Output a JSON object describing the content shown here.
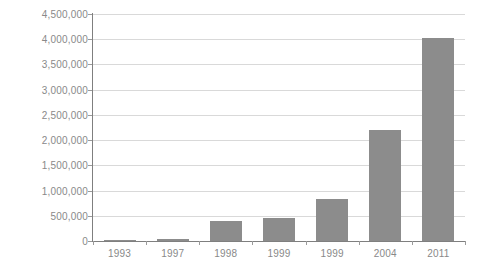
{
  "chart_data": {
    "type": "bar",
    "title": "",
    "subtitle": "",
    "xlabel": "",
    "ylabel": "",
    "categories": [
      "1993",
      "1997",
      "1998",
      "1999",
      "1999",
      "2004",
      "2011"
    ],
    "values": [
      20000,
      40000,
      400000,
      450000,
      830000,
      2200000,
      4030000
    ],
    "series": [
      {
        "name": "",
        "values": [
          20000,
          40000,
          400000,
          450000,
          830000,
          2200000,
          4030000
        ]
      }
    ],
    "ylim": [
      0,
      4500000
    ],
    "ytick_values": [
      0,
      500000,
      1000000,
      1500000,
      2000000,
      2500000,
      3000000,
      3500000,
      4000000,
      4500000
    ],
    "ytick_labels": [
      "0",
      "500,000",
      "1,000,000",
      "1,500,000",
      "2,000,000",
      "2,500,000",
      "3,000,000",
      "3,500,000",
      "4,000,000",
      "4,500,000"
    ],
    "grid": true,
    "grid_axis": "y",
    "legend": false,
    "legend_position": "none",
    "annotations": [],
    "colors": {
      "bar": "#8c8c8c",
      "gridline": "#d9d9d9",
      "axis": "#7f7f7f",
      "tick_label": "#898989",
      "background": "#ffffff"
    }
  }
}
